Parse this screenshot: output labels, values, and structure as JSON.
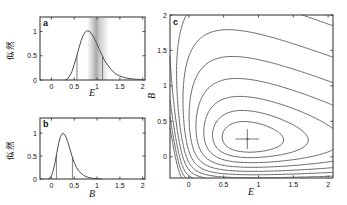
{
  "style": {
    "background": "#ffffff",
    "frame_color": "#2b2b2b",
    "curve_color": "#4d4d4d",
    "contour_color": "#555555",
    "ci_line_color": "#5f5f5f",
    "band_color": "#7f7f7f",
    "marker_color": "#666666",
    "text_color": "#111111"
  },
  "chart_data": [
    {
      "id": "a",
      "type": "line",
      "panel_label": "a",
      "xlabel": "E",
      "ylabel": "似然",
      "x_range": [
        -0.25,
        2.05
      ],
      "y_range": [
        0,
        1.3
      ],
      "x_ticks": [
        0,
        0.5,
        1,
        1.5,
        2
      ],
      "y_ticks": [
        0,
        0.5,
        1
      ],
      "series": [
        {
          "name": "likelihood-of-E",
          "x": [
            0.3,
            0.35,
            0.4,
            0.45,
            0.5,
            0.55,
            0.6,
            0.65,
            0.7,
            0.75,
            0.8,
            0.85,
            0.9,
            0.95,
            1.0,
            1.05,
            1.1,
            1.15,
            1.2,
            1.3,
            1.4,
            1.5,
            1.6,
            1.7,
            1.8,
            1.9,
            2.0
          ],
          "y": [
            0.0,
            0.02,
            0.08,
            0.18,
            0.32,
            0.48,
            0.65,
            0.81,
            0.93,
            1.0,
            1.02,
            0.99,
            0.93,
            0.84,
            0.74,
            0.63,
            0.53,
            0.43,
            0.35,
            0.22,
            0.13,
            0.08,
            0.05,
            0.03,
            0.02,
            0.012,
            0.008
          ]
        }
      ],
      "ci_lines": [
        0.56,
        1.12
      ],
      "band": {
        "from": 0.78,
        "to": 1.26,
        "center": 0.98
      }
    },
    {
      "id": "b",
      "type": "line",
      "panel_label": "b",
      "xlabel": "B",
      "ylabel": "似然",
      "x_range": [
        -0.25,
        2.05
      ],
      "y_range": [
        0,
        1.33
      ],
      "x_ticks": [
        0,
        0.5,
        1,
        1.5,
        2
      ],
      "y_ticks": [
        0,
        0.5,
        1
      ],
      "series": [
        {
          "name": "likelihood-of-B",
          "x": [
            -0.08,
            -0.04,
            0.0,
            0.04,
            0.08,
            0.12,
            0.16,
            0.2,
            0.25,
            0.3,
            0.35,
            0.4,
            0.45,
            0.5,
            0.55,
            0.6,
            0.7,
            0.8,
            0.9,
            1.0,
            1.1
          ],
          "y": [
            0.0,
            0.02,
            0.07,
            0.18,
            0.36,
            0.58,
            0.78,
            0.93,
            1.0,
            0.96,
            0.84,
            0.67,
            0.5,
            0.36,
            0.25,
            0.17,
            0.08,
            0.035,
            0.015,
            0.006,
            0.002
          ]
        }
      ],
      "ci_lines": [
        0.11,
        0.46
      ],
      "band": null
    },
    {
      "id": "c",
      "type": "contour",
      "panel_label": "c",
      "xlabel": "E",
      "ylabel": "B",
      "x_range": [
        -0.27,
        2.07
      ],
      "y_range": [
        -0.3,
        2.0
      ],
      "x_ticks": [
        0,
        0.5,
        1,
        1.5,
        2
      ],
      "y_ticks": [
        0,
        0.5,
        1,
        1.5,
        2
      ],
      "surface": {
        "description": "negative-log-likelihood, lognormal in shifted E and B",
        "E_shift": 0.3,
        "E_scale": 1.14,
        "E_sigma": 0.45,
        "B_shift": 0.5,
        "B_scale": 0.75,
        "B_sigma": 0.34,
        "shear": 0.18
      },
      "levels": [
        0.7,
        1.6,
        3.0,
        5.0,
        7.6,
        10.8,
        14.8,
        19.6,
        26,
        34,
        44
      ],
      "minimum_marker": {
        "E": 0.84,
        "B": 0.25,
        "arm_E": 0.17,
        "arm_B": 0.14
      }
    }
  ]
}
